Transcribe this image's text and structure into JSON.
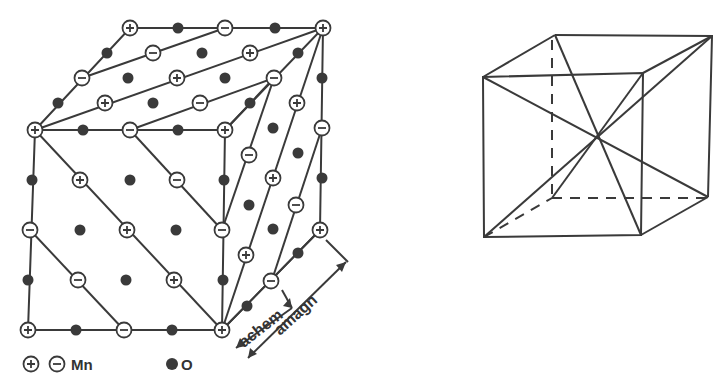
{
  "figure": {
    "left_panel": {
      "title": "MnO rock-salt lattice with antiferromagnetic (111) ordering",
      "legend": {
        "mn_label": "Mn",
        "o_label": "O"
      },
      "dimension_labels": {
        "chemical": "achem",
        "magnetic": "amagn"
      }
    },
    "right_panel": {
      "title": "Cube with body diagonals"
    }
  }
}
